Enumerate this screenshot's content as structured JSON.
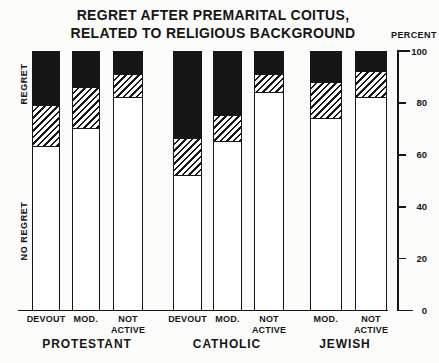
{
  "title": {
    "line1": "REGRET AFTER PREMARITAL COITUS,",
    "line2": "RELATED TO RELIGIOUS BACKGROUND"
  },
  "y_axis": {
    "unit_label": "PERCENT",
    "tick_labels": [
      "100",
      "80",
      "60",
      "40",
      "20",
      "0"
    ]
  },
  "left_labels": {
    "regret": "REGRET",
    "no_regret": "NO REGRET"
  },
  "chart_data": {
    "type": "bar",
    "stacked": true,
    "title": "REGRET AFTER PREMARITAL COITUS, RELATED TO RELIGIOUS BACKGROUND",
    "ylabel": "PERCENT",
    "ylim": [
      0,
      100
    ],
    "grid": false,
    "axis_side": "right",
    "segments": [
      {
        "key": "no_regret",
        "axis_label": "NO REGRET",
        "fill": "white",
        "position": "bottom"
      },
      {
        "key": "partial_regret",
        "axis_label": "",
        "fill": "diagonal-hatch",
        "position": "middle"
      },
      {
        "key": "regret",
        "axis_label": "REGRET",
        "fill": "black",
        "position": "top"
      }
    ],
    "groups": [
      {
        "label": "PROTESTANT",
        "bars": [
          {
            "label": "DEVOUT",
            "no_regret": 63,
            "partial_regret": 16,
            "regret": 21
          },
          {
            "label": "MOD.",
            "no_regret": 70,
            "partial_regret": 16,
            "regret": 14
          },
          {
            "label": "NOT ACTIVE",
            "no_regret": 82,
            "partial_regret": 9,
            "regret": 9
          }
        ]
      },
      {
        "label": "CATHOLIC",
        "bars": [
          {
            "label": "DEVOUT",
            "no_regret": 52,
            "partial_regret": 14,
            "regret": 34
          },
          {
            "label": "MOD.",
            "no_regret": 65,
            "partial_regret": 10,
            "regret": 25
          },
          {
            "label": "NOT ACTIVE",
            "no_regret": 84,
            "partial_regret": 7,
            "regret": 9
          }
        ]
      },
      {
        "label": "JEWISH",
        "bars": [
          {
            "label": "MOD.",
            "no_regret": 74,
            "partial_regret": 14,
            "regret": 12
          },
          {
            "label": "NOT ACTIVE",
            "no_regret": 82,
            "partial_regret": 10,
            "regret": 8
          }
        ]
      }
    ]
  },
  "colors": {
    "ink": "#161616",
    "paper": "#fcfcfa"
  }
}
